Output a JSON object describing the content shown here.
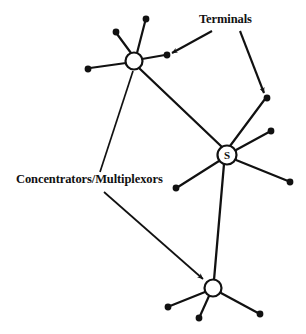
{
  "figure": {
    "kind": "network-topology-diagram",
    "background_color": "#ffffff",
    "stroke_color": "#111111",
    "width": 306,
    "height": 334
  },
  "labels": {
    "terminals": "Terminals",
    "concentrators": "Concentrators/Multiplexors"
  },
  "nodes": {
    "switch": {
      "id": "S",
      "letter": "S",
      "cx": 227,
      "cy": 155,
      "r": 9.5,
      "role": "switch"
    },
    "concentrator_top": {
      "id": "C1",
      "letter": "",
      "cx": 134,
      "cy": 61,
      "r": 8.5,
      "role": "concentrator"
    },
    "concentrator_bottom": {
      "id": "C2",
      "letter": "",
      "cx": 213,
      "cy": 288,
      "r": 8.5,
      "role": "concentrator"
    }
  },
  "terminal_dots": [
    {
      "id": "t1",
      "cx": 116,
      "cy": 32,
      "parent": "C1"
    },
    {
      "id": "t2",
      "cx": 146,
      "cy": 19,
      "parent": "C1"
    },
    {
      "id": "t3",
      "cx": 88,
      "cy": 69,
      "parent": "C1"
    },
    {
      "id": "t4",
      "cx": 167,
      "cy": 55,
      "parent": "C1"
    },
    {
      "id": "t5",
      "cx": 267,
      "cy": 98,
      "parent": "S"
    },
    {
      "id": "t6",
      "cx": 271,
      "cy": 131,
      "parent": "S"
    },
    {
      "id": "t7",
      "cx": 290,
      "cy": 182,
      "parent": "S"
    },
    {
      "id": "t8",
      "cx": 176,
      "cy": 188,
      "parent": "S"
    },
    {
      "id": "t9",
      "cx": 168,
      "cy": 307,
      "parent": "C2"
    },
    {
      "id": "t10",
      "cx": 199,
      "cy": 318,
      "parent": "C2"
    },
    {
      "id": "t11",
      "cx": 260,
      "cy": 314,
      "parent": "C2"
    }
  ],
  "trunk_links": [
    {
      "id": "trunk-c1-s",
      "from": "C1",
      "to": "S"
    },
    {
      "id": "trunk-s-c2",
      "from": "S",
      "to": "C2"
    }
  ],
  "leader_lines": [
    {
      "id": "terminals-leader-left",
      "label": "terminals",
      "x1": 212,
      "y1": 31,
      "x2": 170,
      "y2": 54,
      "arrow": true
    },
    {
      "id": "terminals-leader-right",
      "label": "terminals",
      "x1": 240,
      "y1": 31,
      "x2": 265,
      "y2": 95,
      "arrow": true
    },
    {
      "id": "concentrators-leader-up",
      "label": "concentrators",
      "x1": 100,
      "y1": 172,
      "x2": 133,
      "y2": 71,
      "arrow": false
    },
    {
      "id": "concentrators-leader-down",
      "label": "concentrators",
      "x1": 104,
      "y1": 192,
      "x2": 205,
      "y2": 281,
      "arrow": true
    }
  ],
  "counts": {
    "nodes": 3,
    "terminals": 11
  }
}
